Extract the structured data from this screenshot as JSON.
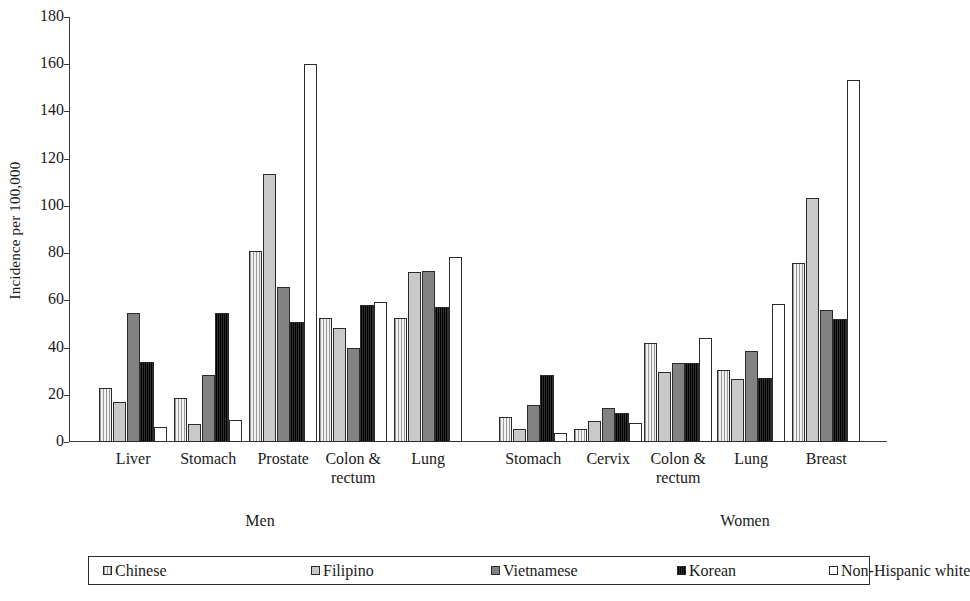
{
  "chart_data": {
    "type": "bar",
    "title": "",
    "xlabel": "",
    "ylabel": "Incidence per 100,000",
    "ylim": [
      0,
      180
    ],
    "ytick_labels": [
      "0",
      "20",
      "40",
      "60",
      "80",
      "100",
      "120",
      "140",
      "160",
      "180"
    ],
    "yticks": [
      0,
      20,
      40,
      60,
      80,
      100,
      120,
      140,
      160,
      180
    ],
    "grid": false,
    "legend_position": "bottom",
    "panels": [
      {
        "label": "Men",
        "categories": [
          "Liver",
          "Stomach",
          "Prostate",
          "Colon &\nrectum",
          "Lung"
        ]
      },
      {
        "label": "Women",
        "categories": [
          "Stomach",
          "Cervix",
          "Colon &\nrectum",
          "Lung",
          "Breast"
        ]
      }
    ],
    "series": [
      {
        "name": "Chinese",
        "color": "#e4e4e4",
        "values": [
          23,
          18.5,
          81,
          52.5,
          52.5,
          10.5,
          5.5,
          42,
          30.5,
          76
        ]
      },
      {
        "name": "Filipino",
        "color": "#c9c9c9",
        "values": [
          17,
          7.5,
          113.5,
          48.5,
          72,
          5.5,
          9,
          29.5,
          26.5,
          103.5
        ]
      },
      {
        "name": "Vietnamese",
        "color": "#828282",
        "values": [
          54.5,
          28.5,
          65.5,
          40,
          72.5,
          15.5,
          14.5,
          33.5,
          38.5,
          56
        ]
      },
      {
        "name": "Korean",
        "color": "#161616",
        "values": [
          34,
          54.5,
          51,
          58,
          57,
          28.5,
          12.5,
          33.5,
          27,
          52
        ]
      },
      {
        "name": "Non-Hispanic white",
        "color": "#ffffff",
        "values": [
          6.5,
          9.5,
          160,
          59.5,
          78.5,
          4,
          8,
          44,
          58.5,
          153.5
        ]
      }
    ],
    "categories_flat": [
      "Liver",
      "Stomach",
      "Prostate",
      "Colon & rectum",
      "Lung",
      "Stomach",
      "Cervix",
      "Colon & rectum",
      "Lung",
      "Breast"
    ]
  },
  "legend": {
    "entries": [
      {
        "label": "Chinese",
        "swatch": "chinese"
      },
      {
        "label": "Filipino",
        "swatch": "filipino"
      },
      {
        "label": "Vietnamese",
        "swatch": "vietnamese"
      },
      {
        "label": "Korean",
        "swatch": "korean"
      },
      {
        "label": "Non-Hispanic white",
        "swatch": "nhw"
      }
    ]
  },
  "axis": {
    "ylabel": "Incidence per 100,000"
  }
}
